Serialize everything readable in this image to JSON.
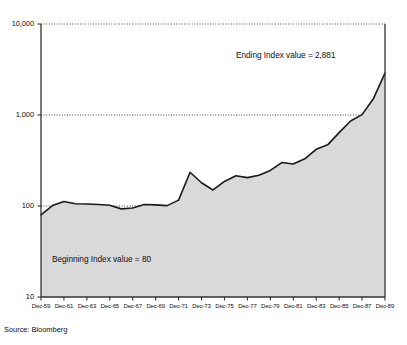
{
  "source_note": "Source: Bloomberg",
  "annotations": {
    "ending": "Ending Index value = 2,881",
    "beginning": "Beginning Index value = 80"
  },
  "chart_data": {
    "type": "area",
    "title": "",
    "subtitle": "",
    "xlabel": "",
    "ylabel": "",
    "yscale": "log",
    "ylim": [
      10,
      10000
    ],
    "grid": true,
    "gridlines": [
      10000,
      1000,
      100
    ],
    "gridline_style": "dotted",
    "legend": "none",
    "area_fill_color": "#d9d9d9",
    "line_color": "#1a1a1a",
    "axis_color": "#333333",
    "ytick_labels": [
      "10,000",
      "1,000",
      "100",
      "10"
    ],
    "ytick_values": [
      10000,
      1000,
      100,
      10
    ],
    "xtick_labels": [
      "Dec-59",
      "Dec-61",
      "Dec-63",
      "Dec-65",
      "Dec-67",
      "Dec-69",
      "Dec-71",
      "Dec-73",
      "Dec-75",
      "Dec-77",
      "Dec-79",
      "Dec-81",
      "Dec-83",
      "Dec-85",
      "Dec-87",
      "Dec-89"
    ],
    "xtick_values": [
      1959,
      1961,
      1963,
      1965,
      1967,
      1969,
      1971,
      1973,
      1975,
      1977,
      1979,
      1981,
      1983,
      1985,
      1987,
      1989
    ],
    "xlim": [
      1959,
      1989
    ],
    "x": [
      1959,
      1960,
      1961,
      1962,
      1963,
      1964,
      1965,
      1966,
      1967,
      1968,
      1969,
      1970,
      1971,
      1972,
      1973,
      1974,
      1975,
      1976,
      1977,
      1978,
      1979,
      1980,
      1981,
      1982,
      1983,
      1984,
      1985,
      1986,
      1987,
      1988,
      1989
    ],
    "values": [
      80,
      101,
      112,
      106,
      105,
      104,
      102,
      93,
      95,
      104,
      103,
      101,
      116,
      235,
      180,
      150,
      186,
      215,
      205,
      218,
      246,
      300,
      290,
      330,
      420,
      470,
      640,
      860,
      1010,
      1520,
      2881
    ],
    "series": [
      {
        "name": "Index value",
        "values": [
          80,
          101,
          112,
          106,
          105,
          104,
          102,
          93,
          95,
          104,
          103,
          101,
          116,
          235,
          180,
          150,
          186,
          215,
          205,
          218,
          246,
          300,
          290,
          330,
          420,
          470,
          640,
          860,
          1010,
          1520,
          2881
        ]
      }
    ],
    "beginning_value": 80,
    "ending_value": 2881
  }
}
